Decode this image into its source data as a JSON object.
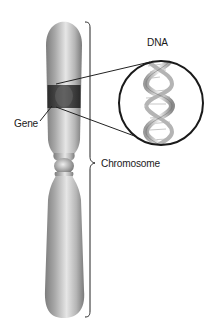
{
  "figure": {
    "labels": {
      "dna": "DNA",
      "gene": "Gene",
      "chromosome": "Chromosome"
    },
    "colors": {
      "chromosome_light": "#d8d8d8",
      "chromosome_mid": "#a9a9a9",
      "chromosome_dark": "#6e6e6e",
      "gene_band": "#3a3a3a",
      "outline": "#222222",
      "background": "#ffffff"
    }
  }
}
